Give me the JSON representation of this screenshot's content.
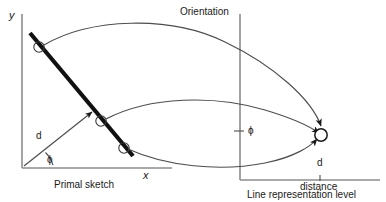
{
  "figure": {
    "title": "",
    "type": "conceptual-diagram",
    "width": 386,
    "height": 202,
    "background_color": "#ffffff",
    "stroke_color": "#1a1a1a",
    "axis_color": "#8c8c8c",
    "curve_color": "#4d4d4d",
    "text_color": "#1a1a1a"
  },
  "left_panel": {
    "caption": "Primal sketch",
    "y_axis_label": "y",
    "x_axis_label": "x",
    "distance_label": "d",
    "angle_label": "ϕ",
    "markers": [
      {
        "name": "line-point-1",
        "label": ""
      },
      {
        "name": "line-point-2",
        "label": ""
      },
      {
        "name": "line-point-3",
        "label": ""
      }
    ]
  },
  "right_panel": {
    "header_label": "Orientation",
    "caption": "Line representation level",
    "x_axis_label": "distance",
    "distance_tick_label": "d",
    "orientation_tick_label": "ϕ",
    "markers": [
      {
        "name": "converged-point",
        "label": ""
      }
    ]
  },
  "annotations": {
    "arrow_count": 3,
    "mapping_description": ""
  }
}
